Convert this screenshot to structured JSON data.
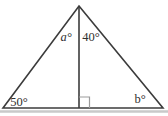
{
  "diagram": {
    "type": "triangle-with-altitude",
    "labels": {
      "apex_left": "a°",
      "apex_right": "40°",
      "base_left": "50°",
      "base_right": "b°"
    },
    "colors": {
      "line": "#3c3c3c",
      "right_angle_mark": "#9b9b9b",
      "shadow": "#c9c9c9",
      "text": "#2f2f2f",
      "background": "#ffffff"
    }
  }
}
